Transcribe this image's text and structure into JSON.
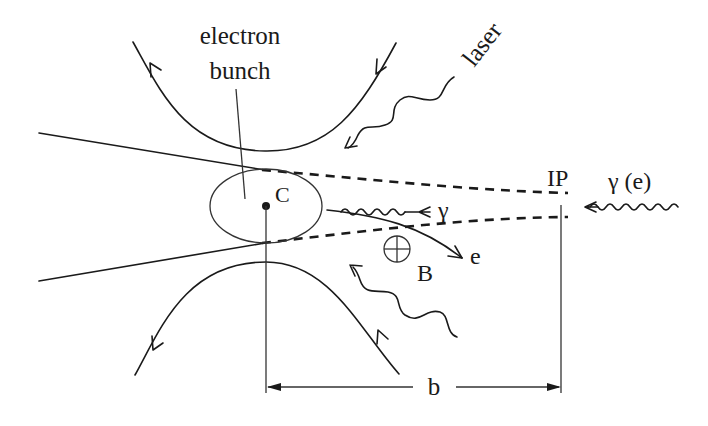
{
  "diagram": {
    "labels": {
      "electron_bunch_line1": "electron",
      "electron_bunch_line2": "bunch",
      "laser": "laser",
      "center": "C",
      "gamma": "γ",
      "electron": "e",
      "magnetic_field": "B",
      "interaction_point": "IP",
      "incoming_beam": "γ (e)",
      "distance": "b"
    },
    "colors": {
      "ink": "#1a1a1a",
      "background": "#ffffff"
    },
    "icons": {
      "magnetic_field_symbol": "circle-plus (field into page)"
    }
  }
}
